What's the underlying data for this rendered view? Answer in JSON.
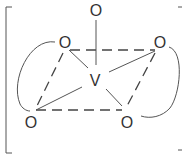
{
  "diagram": {
    "type": "chemical-structure",
    "central_atom": {
      "label": "V",
      "x": 95,
      "y": 86
    },
    "atoms": [
      {
        "id": "o_top",
        "label": "O",
        "x": 96,
        "y": 16
      },
      {
        "id": "o_ul",
        "label": "O",
        "x": 65,
        "y": 48
      },
      {
        "id": "o_ur",
        "label": "O",
        "x": 160,
        "y": 48
      },
      {
        "id": "o_ll",
        "label": "O",
        "x": 31,
        "y": 128
      },
      {
        "id": "o_lr",
        "label": "O",
        "x": 127,
        "y": 128
      }
    ],
    "bonds": {
      "solid": [
        [
          "o_top",
          "V"
        ],
        [
          "o_ul",
          "V"
        ],
        [
          "o_ur",
          "V"
        ],
        [
          "o_ll",
          "V"
        ],
        [
          "o_lr",
          "V"
        ]
      ],
      "dashed": [
        [
          "o_ul",
          "o_ur"
        ],
        [
          "o_ul",
          "o_ll"
        ],
        [
          "o_ur",
          "o_lr"
        ],
        [
          "o_ll",
          "o_lr"
        ]
      ],
      "arcs": [
        [
          "o_ul",
          "o_ll"
        ],
        [
          "o_ur",
          "o_lr"
        ]
      ]
    },
    "enclosure": "square-brackets"
  }
}
